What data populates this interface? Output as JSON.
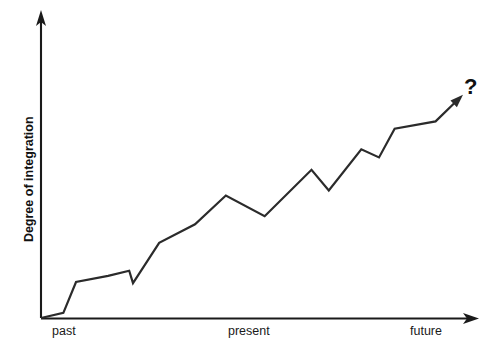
{
  "chart_data": {
    "type": "line",
    "title": "",
    "subtitle": "",
    "xlabel": "",
    "ylabel": "Degree of integration",
    "grid": false,
    "legend": null,
    "xlim": [
      0,
      100
    ],
    "ylim": [
      0,
      100
    ],
    "categories": [
      "past",
      "present",
      "future"
    ],
    "xticklabels": [
      "past",
      "present",
      "future"
    ],
    "yticklabels": [],
    "annotations": [
      {
        "text": "?",
        "x": 99,
        "y": 97,
        "bold": true,
        "note": "uncertainty marker at the arrow tip of the trend line"
      }
    ],
    "series": [
      {
        "name": "Degree of integration over time",
        "arrow_end": true,
        "points": [
          {
            "x": 0.0,
            "y": 0.0
          },
          {
            "x": 5.3,
            "y": 2.4
          },
          {
            "x": 8.3,
            "y": 16.9
          },
          {
            "x": 15.9,
            "y": 19.8
          },
          {
            "x": 20.9,
            "y": 22.2
          },
          {
            "x": 21.8,
            "y": 16.4
          },
          {
            "x": 28.0,
            "y": 35.3
          },
          {
            "x": 36.5,
            "y": 44.0
          },
          {
            "x": 43.8,
            "y": 57.5
          },
          {
            "x": 53.0,
            "y": 47.8
          },
          {
            "x": 64.1,
            "y": 69.6
          },
          {
            "x": 68.2,
            "y": 59.9
          },
          {
            "x": 75.9,
            "y": 79.2
          },
          {
            "x": 80.1,
            "y": 75.4
          },
          {
            "x": 83.8,
            "y": 88.9
          },
          {
            "x": 93.5,
            "y": 92.3
          },
          {
            "x": 100.0,
            "y": 104.8
          }
        ]
      }
    ]
  },
  "axes": {
    "y_axis_title": "Degree of integration",
    "x_tick_past": "past",
    "x_tick_present": "present",
    "x_tick_future": "future"
  },
  "colors": {
    "background": "#ffffff",
    "axis": "#1a1a1a",
    "line": "#2b2b2b",
    "text": "#111111"
  }
}
